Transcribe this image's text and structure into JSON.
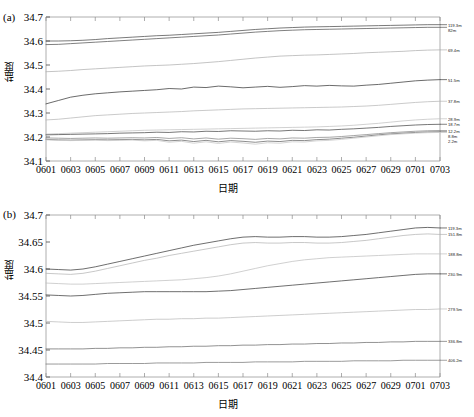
{
  "figure": {
    "panels": [
      {
        "tag": "(a)",
        "xlabel": "日期",
        "ylabel": "盐度",
        "ylim": [
          34.1,
          34.7
        ],
        "yticks": [
          "34.1",
          "34.2",
          "34.3",
          "34.4",
          "34.5",
          "34.6",
          "34.7"
        ],
        "xticks": [
          "0601",
          "0603",
          "0605",
          "0607",
          "0609",
          "0611",
          "0613",
          "0615",
          "0617",
          "0619",
          "0621",
          "0623",
          "0625",
          "0627",
          "0629",
          "0701",
          "0703"
        ]
      },
      {
        "tag": "(b)",
        "xlabel": "日期",
        "ylabel": "盐度",
        "ylim": [
          34.4,
          34.7
        ],
        "yticks": [
          "34.4",
          "34.45",
          "34.5",
          "34.55",
          "34.6",
          "34.65",
          "34.7"
        ],
        "xticks": [
          "0601",
          "0603",
          "0605",
          "0607",
          "0609",
          "0611",
          "0613",
          "0615",
          "0617",
          "0619",
          "0621",
          "0623",
          "0625",
          "0627",
          "0629",
          "0701",
          "0703"
        ]
      }
    ]
  },
  "chart_data": [
    {
      "type": "line",
      "title": "",
      "subtitle": "",
      "panel": "(a)",
      "xlabel": "日期",
      "ylabel": "盐度",
      "x": [
        "0601",
        "0602",
        "0603",
        "0604",
        "0605",
        "0606",
        "0607",
        "0608",
        "0609",
        "0610",
        "0611",
        "0612",
        "0613",
        "0614",
        "0615",
        "0616",
        "0617",
        "0618",
        "0619",
        "0620",
        "0621",
        "0622",
        "0623",
        "0624",
        "0625",
        "0626",
        "0627",
        "0628",
        "0629",
        "0630",
        "0701",
        "0702",
        "0703"
      ],
      "xlim": [
        0,
        32
      ],
      "ylim": [
        34.1,
        34.7
      ],
      "grid": false,
      "legend_position": "right-inline",
      "series": [
        {
          "name": "119.3m",
          "label": "119.3m",
          "color": "#4d4d4d",
          "values": [
            34.6,
            34.6,
            34.601,
            34.603,
            34.606,
            34.61,
            34.613,
            34.616,
            34.619,
            34.622,
            34.624,
            34.627,
            34.63,
            34.633,
            34.636,
            34.64,
            34.644,
            34.648,
            34.651,
            34.654,
            34.656,
            34.658,
            34.659,
            34.66,
            34.661,
            34.662,
            34.663,
            34.664,
            34.665,
            34.666,
            34.667,
            34.668,
            34.668
          ]
        },
        {
          "name": "82m",
          "label": "82m",
          "color": "#555555",
          "values": [
            34.585,
            34.586,
            34.589,
            34.592,
            34.595,
            34.598,
            34.601,
            34.604,
            34.607,
            34.61,
            34.613,
            34.616,
            34.619,
            34.622,
            34.625,
            34.629,
            34.633,
            34.637,
            34.64,
            34.643,
            34.645,
            34.647,
            34.648,
            34.649,
            34.65,
            34.651,
            34.652,
            34.653,
            34.654,
            34.655,
            34.656,
            34.657,
            34.657
          ]
        },
        {
          "name": "69.4m",
          "label": "69.4m",
          "color": "#b0b0b0",
          "values": [
            34.472,
            34.474,
            34.477,
            34.481,
            34.484,
            34.487,
            34.49,
            34.493,
            34.496,
            34.498,
            34.5,
            34.503,
            34.506,
            34.51,
            34.514,
            34.519,
            34.524,
            34.529,
            34.533,
            34.537,
            34.539,
            34.541,
            34.542,
            34.544,
            34.546,
            34.548,
            34.551,
            34.553,
            34.555,
            34.557,
            34.56,
            34.562,
            34.563
          ]
        },
        {
          "name": "51.5m",
          "label": "51.5m",
          "color": "#3a3a3a",
          "values": [
            34.338,
            34.352,
            34.366,
            34.374,
            34.38,
            34.384,
            34.388,
            34.391,
            34.394,
            34.397,
            34.402,
            34.4,
            34.408,
            34.406,
            34.412,
            34.409,
            34.405,
            34.408,
            34.411,
            34.407,
            34.41,
            34.414,
            34.412,
            34.415,
            34.413,
            34.412,
            34.416,
            34.419,
            34.424,
            34.429,
            34.434,
            34.437,
            34.439
          ]
        },
        {
          "name": "37.8m",
          "label": "37.8m",
          "color": "#b8b8b8",
          "values": [
            34.271,
            34.274,
            34.279,
            34.284,
            34.289,
            34.292,
            34.295,
            34.298,
            34.3,
            34.302,
            34.304,
            34.306,
            34.309,
            34.311,
            34.313,
            34.315,
            34.317,
            34.318,
            34.319,
            34.32,
            34.321,
            34.322,
            34.323,
            34.324,
            34.325,
            34.327,
            34.329,
            34.332,
            34.336,
            34.34,
            34.344,
            34.347,
            34.349
          ]
        },
        {
          "name": "28.9m",
          "label": "28.9m",
          "color": "#c2c2c2",
          "values": [
            34.212,
            34.214,
            34.216,
            34.218,
            34.22,
            34.222,
            34.224,
            34.226,
            34.228,
            34.229,
            34.23,
            34.231,
            34.232,
            34.233,
            34.234,
            34.235,
            34.236,
            34.237,
            34.238,
            34.239,
            34.24,
            34.241,
            34.242,
            34.244,
            34.246,
            34.249,
            34.253,
            34.257,
            34.262,
            34.267,
            34.271,
            34.274,
            34.276
          ]
        },
        {
          "name": "18.7m",
          "label": "18.7m",
          "color": "#4a4a4a",
          "values": [
            34.209,
            34.21,
            34.211,
            34.212,
            34.213,
            34.214,
            34.216,
            34.217,
            34.218,
            34.22,
            34.219,
            34.222,
            34.221,
            34.224,
            34.223,
            34.226,
            34.225,
            34.224,
            34.226,
            34.225,
            34.228,
            34.227,
            34.23,
            34.229,
            34.232,
            34.234,
            34.237,
            34.24,
            34.244,
            34.247,
            34.25,
            34.252,
            34.253
          ]
        },
        {
          "name": "12.2m",
          "label": "12.2m",
          "color": "#888888",
          "values": [
            34.196,
            34.195,
            34.194,
            34.195,
            34.196,
            34.195,
            34.196,
            34.197,
            34.196,
            34.198,
            34.194,
            34.197,
            34.192,
            34.196,
            34.191,
            34.195,
            34.193,
            34.19,
            34.194,
            34.192,
            34.196,
            34.195,
            34.198,
            34.199,
            34.202,
            34.206,
            34.21,
            34.214,
            34.218,
            34.221,
            34.224,
            34.226,
            34.227
          ]
        },
        {
          "name": "8.8m",
          "label": "8.8m",
          "color": "#676767",
          "values": [
            34.19,
            34.188,
            34.187,
            34.188,
            34.189,
            34.188,
            34.189,
            34.19,
            34.188,
            34.19,
            34.184,
            34.187,
            34.181,
            34.186,
            34.18,
            34.185,
            34.182,
            34.178,
            34.183,
            34.181,
            34.186,
            34.185,
            34.189,
            34.191,
            34.195,
            34.199,
            34.204,
            34.209,
            34.213,
            34.216,
            34.219,
            34.221,
            34.222
          ]
        },
        {
          "name": "2.2m",
          "label": "2.2m",
          "color": "#c8c8c8",
          "values": [
            34.188,
            34.186,
            34.185,
            34.186,
            34.187,
            34.185,
            34.186,
            34.187,
            34.184,
            34.186,
            34.178,
            34.182,
            34.174,
            34.18,
            34.173,
            34.179,
            34.175,
            34.17,
            34.176,
            34.174,
            34.18,
            34.179,
            34.184,
            34.186,
            34.19,
            34.195,
            34.2,
            34.205,
            34.21,
            34.213,
            34.216,
            34.218,
            34.219
          ]
        }
      ]
    },
    {
      "type": "line",
      "title": "",
      "subtitle": "",
      "panel": "(b)",
      "xlabel": "日期",
      "ylabel": "盐度",
      "x": [
        "0601",
        "0602",
        "0603",
        "0604",
        "0605",
        "0606",
        "0607",
        "0608",
        "0609",
        "0610",
        "0611",
        "0612",
        "0613",
        "0614",
        "0615",
        "0616",
        "0617",
        "0618",
        "0619",
        "0620",
        "0621",
        "0622",
        "0623",
        "0624",
        "0625",
        "0626",
        "0627",
        "0628",
        "0629",
        "0630",
        "0701",
        "0702",
        "0703"
      ],
      "xlim": [
        0,
        32
      ],
      "ylim": [
        34.4,
        34.7
      ],
      "grid": false,
      "legend_position": "right-inline",
      "series": [
        {
          "name": "119.3m",
          "label": "119.3m",
          "color": "#3d3d3d",
          "values": [
            34.6,
            34.599,
            34.598,
            34.6,
            34.604,
            34.609,
            34.614,
            34.619,
            34.624,
            34.629,
            34.634,
            34.639,
            34.644,
            34.648,
            34.652,
            34.656,
            34.659,
            34.66,
            34.659,
            34.659,
            34.66,
            34.66,
            34.659,
            34.659,
            34.66,
            34.662,
            34.664,
            34.667,
            34.67,
            34.673,
            34.676,
            34.677,
            34.676
          ]
        },
        {
          "name": "151.8m",
          "label": "151.8m",
          "color": "#b5b5b5",
          "values": [
            34.592,
            34.591,
            34.59,
            34.592,
            34.596,
            34.601,
            34.606,
            34.611,
            34.616,
            34.62,
            34.625,
            34.629,
            34.633,
            34.637,
            34.641,
            34.645,
            34.648,
            34.649,
            34.648,
            34.648,
            34.649,
            34.649,
            34.648,
            34.648,
            34.649,
            34.651,
            34.653,
            34.656,
            34.659,
            34.662,
            34.664,
            34.665,
            34.664
          ]
        },
        {
          "name": "188.8m",
          "label": "188.8m",
          "color": "#c0c0c0",
          "values": [
            34.574,
            34.573,
            34.572,
            34.572,
            34.573,
            34.574,
            34.575,
            34.576,
            34.577,
            34.578,
            34.579,
            34.58,
            34.582,
            34.584,
            34.587,
            34.591,
            34.596,
            34.601,
            34.606,
            34.61,
            34.614,
            34.617,
            34.619,
            34.621,
            34.622,
            34.623,
            34.624,
            34.625,
            34.626,
            34.627,
            34.628,
            34.628,
            34.628
          ]
        },
        {
          "name": "230.9m",
          "label": "230.9m",
          "color": "#3f3f3f",
          "values": [
            34.552,
            34.551,
            34.55,
            34.551,
            34.553,
            34.555,
            34.556,
            34.557,
            34.558,
            34.558,
            34.558,
            34.558,
            34.558,
            34.558,
            34.559,
            34.56,
            34.562,
            34.564,
            34.566,
            34.568,
            34.57,
            34.572,
            34.574,
            34.576,
            34.578,
            34.58,
            34.582,
            34.584,
            34.586,
            34.588,
            34.59,
            34.591,
            34.591
          ]
        },
        {
          "name": "279.5m",
          "label": "279.5m",
          "color": "#bcbcbc",
          "values": [
            34.503,
            34.502,
            34.501,
            34.501,
            34.502,
            34.503,
            34.504,
            34.505,
            34.506,
            34.507,
            34.507,
            34.508,
            34.508,
            34.509,
            34.509,
            34.51,
            34.511,
            34.512,
            34.513,
            34.514,
            34.515,
            34.516,
            34.517,
            34.518,
            34.519,
            34.52,
            34.521,
            34.522,
            34.523,
            34.524,
            34.525,
            34.525,
            34.526
          ]
        },
        {
          "name": "336.8m",
          "label": "336.8m",
          "color": "#6e6e6e",
          "values": [
            34.452,
            34.452,
            34.452,
            34.452,
            34.453,
            34.453,
            34.454,
            34.454,
            34.455,
            34.455,
            34.456,
            34.456,
            34.457,
            34.457,
            34.458,
            34.458,
            34.459,
            34.459,
            34.46,
            34.46,
            34.461,
            34.461,
            34.462,
            34.462,
            34.463,
            34.463,
            34.464,
            34.464,
            34.465,
            34.465,
            34.466,
            34.466,
            34.466
          ]
        },
        {
          "name": "406.2m",
          "label": "406.2m",
          "color": "#7a7a7a",
          "values": [
            34.424,
            34.424,
            34.424,
            34.424,
            34.424,
            34.425,
            34.425,
            34.425,
            34.425,
            34.426,
            34.426,
            34.426,
            34.426,
            34.427,
            34.427,
            34.427,
            34.427,
            34.428,
            34.428,
            34.428,
            34.428,
            34.429,
            34.429,
            34.429,
            34.429,
            34.43,
            34.43,
            34.43,
            34.43,
            34.431,
            34.431,
            34.431,
            34.431
          ]
        }
      ]
    }
  ]
}
